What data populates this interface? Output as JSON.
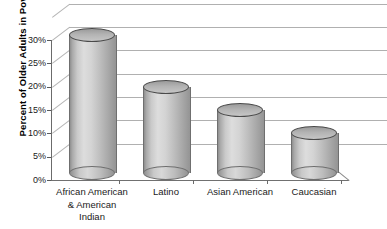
{
  "chart_data": {
    "type": "bar",
    "title": "",
    "xlabel": "",
    "ylabel": "Percent of Older Adults in Poverty",
    "categories": [
      "African American\n& American\nIndian",
      "Latino",
      "Asian American",
      "Caucasian"
    ],
    "values": [
      31,
      20,
      15,
      10
    ],
    "ylim": [
      0,
      30
    ],
    "ytick_labels": [
      "30%",
      "25%",
      "20%",
      "15%",
      "10%",
      "5%",
      "0%"
    ],
    "ytick_values": [
      30,
      25,
      20,
      15,
      10,
      5,
      0
    ],
    "grid": true,
    "legend": "none",
    "style": "3d-cylinder"
  },
  "axis": {
    "y_title": "Percent of Older Adults in Poverty",
    "ticks": [
      {
        "label": "30%",
        "value": 30
      },
      {
        "label": "25%",
        "value": 25
      },
      {
        "label": "20%",
        "value": 20
      },
      {
        "label": "15%",
        "value": 15
      },
      {
        "label": "10%",
        "value": 10
      },
      {
        "label": "5%",
        "value": 5
      },
      {
        "label": "0%",
        "value": 0
      }
    ]
  },
  "categories": [
    {
      "line1": "African American",
      "line2": "& American",
      "line3": "Indian",
      "value": 31
    },
    {
      "line1": "Latino",
      "line2": "",
      "line3": "",
      "value": 20
    },
    {
      "line1": "Asian American",
      "line2": "",
      "line3": "",
      "value": 15
    },
    {
      "line1": "Caucasian",
      "line2": "",
      "line3": "",
      "value": 10
    }
  ],
  "colors": {
    "cylinder_light": "#dddddd",
    "cylinder_mid": "#bdbdbd",
    "cylinder_dark": "#8f8f8f",
    "cylinder_outline": "#6f6f6f",
    "cylinder_top": "#b3b3b3",
    "gridline": "#b4b4b4",
    "axis": "#6b6b6b",
    "text": "#1a1a1a",
    "background": "#ffffff"
  }
}
